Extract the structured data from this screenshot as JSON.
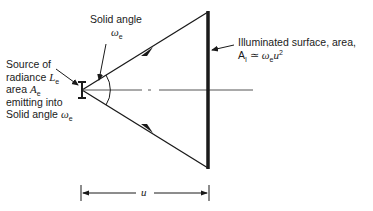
{
  "figure": {
    "type": "optics-diagram",
    "labels": {
      "solid_angle": {
        "line1": "Solid angle",
        "symbol": "ω",
        "symbol_sub": "e"
      },
      "source": {
        "line1": "Source of",
        "line2_text": "radiance ",
        "line2_sym": "L",
        "line2_sub": "e",
        "line3_text": "area ",
        "line3_sym": "A",
        "line3_sub": "e",
        "line4": "emitting into",
        "line5_text": "Solid angle ",
        "line5_sym": "ω",
        "line5_sub": "e"
      },
      "surface": {
        "line1": "Illuminated surface, area,",
        "line2_sym": "A",
        "line2_sub": "I",
        "line2_rel": " ≃ ",
        "line2_omega": "ω",
        "line2_omega_sub": "e",
        "line2_u": "u",
        "line2_exp": "2"
      },
      "distance": "u"
    },
    "colors": {
      "line": "#1a1a1a",
      "background": "#ffffff"
    }
  }
}
